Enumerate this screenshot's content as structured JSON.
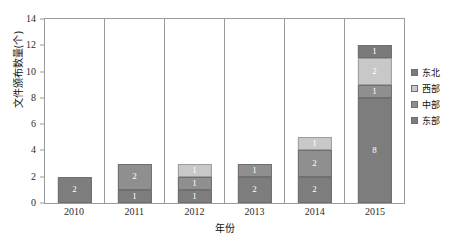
{
  "chart_data": {
    "type": "bar",
    "stacked": true,
    "title": "",
    "xlabel": "年份",
    "ylabel": "文件颁布数量(个)",
    "categories": [
      "2010",
      "2011",
      "2012",
      "2013",
      "2014",
      "2015"
    ],
    "ylim": [
      0,
      14
    ],
    "yticks": [
      0,
      2,
      4,
      6,
      8,
      10,
      12,
      14
    ],
    "grid": false,
    "legend_position": "right",
    "legend_order": [
      "东北",
      "西部",
      "中部",
      "东部"
    ],
    "stack_order_bottom_to_top": [
      "东部",
      "中部",
      "西部",
      "东北"
    ],
    "series": [
      {
        "name": "东部",
        "color": "#7d7d7d",
        "values": [
          2,
          1,
          1,
          2,
          2,
          8
        ],
        "labels": [
          "2",
          "1",
          "1",
          "2",
          "2",
          "8"
        ]
      },
      {
        "name": "中部",
        "color": "#8f8f8f",
        "values": [
          0,
          2,
          1,
          1,
          2,
          1
        ],
        "labels": [
          "",
          "2",
          "1",
          "1",
          "2",
          "1"
        ]
      },
      {
        "name": "西部",
        "color": "#c8c8c8",
        "values": [
          0,
          0,
          1,
          0,
          1,
          2
        ],
        "labels": [
          "",
          "",
          "1",
          "",
          "1",
          "2"
        ]
      },
      {
        "name": "东北",
        "color": "#7a7a7a",
        "values": [
          0,
          0,
          0,
          0,
          0,
          1
        ],
        "labels": [
          "",
          "",
          "",
          "",
          "",
          "1"
        ]
      }
    ],
    "totals": [
      2,
      3,
      3,
      3,
      5,
      12
    ]
  },
  "axes": {
    "y_tick_labels": [
      "14",
      "12",
      "10",
      "8",
      "6",
      "4",
      "2",
      "0"
    ],
    "y_label": "文件颁布数量(个)",
    "x_tick_labels": [
      "2010",
      "2011",
      "2012",
      "2013",
      "2014",
      "2015"
    ],
    "x_label": "年份"
  },
  "legend": {
    "items": [
      {
        "label": "东北",
        "color": "#7a7a7a"
      },
      {
        "label": "西部",
        "color": "#c8c8c8"
      },
      {
        "label": "中部",
        "color": "#8f8f8f"
      },
      {
        "label": "东部",
        "color": "#7d7d7d"
      }
    ]
  },
  "artifact": {
    "top_text": ""
  }
}
